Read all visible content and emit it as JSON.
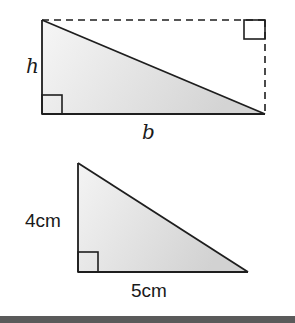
{
  "figure": {
    "type": "geometry-illustration"
  },
  "diagram1": {
    "name": "general-right-triangle-in-rectangle",
    "labels": {
      "height": "h",
      "base": "b"
    },
    "rectangle": {
      "x": 42,
      "y": 20,
      "width": 223,
      "height": 94,
      "dashed_sides": [
        "top",
        "right"
      ]
    },
    "triangle_vertices": [
      [
        42,
        20
      ],
      [
        42,
        114
      ],
      [
        265,
        114
      ]
    ],
    "right_angle_markers": [
      "bottom-left",
      "top-right"
    ]
  },
  "diagram2": {
    "name": "example-right-triangle",
    "labels": {
      "height": "4cm",
      "base": "5cm"
    },
    "triangle_vertices": [
      [
        78,
        163
      ],
      [
        78,
        272
      ],
      [
        248,
        272
      ]
    ],
    "right_angle_markers": [
      "bottom-left"
    ]
  },
  "colors": {
    "stroke": "#1e1e1e",
    "fill_light": "#f3f3f3",
    "fill_dark": "#d6d6d6",
    "bottom_bar": "#5a5a5a"
  }
}
